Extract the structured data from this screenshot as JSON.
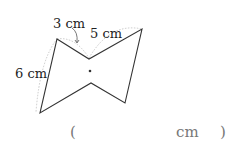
{
  "figure": {
    "labels": {
      "side_top_left": "3 cm",
      "side_top_right": "5 cm",
      "side_left": "6 cm"
    },
    "center_dot": true
  },
  "answer": {
    "open_paren": "(",
    "unit": "cm",
    "close_paren": ")",
    "value": ""
  }
}
